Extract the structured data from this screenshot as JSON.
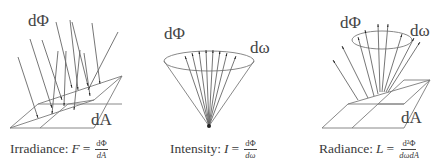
{
  "panels": [
    {
      "id": "irradiance",
      "labels": {
        "flux": "dΦ",
        "area": "dA"
      },
      "caption": {
        "name": "Irradiance:",
        "symbol": "F",
        "equals": "=",
        "numerator": "dΦ",
        "denominator": "dA"
      }
    },
    {
      "id": "intensity",
      "labels": {
        "flux": "dΦ",
        "solid_angle": "dω"
      },
      "caption": {
        "name": "Intensity:",
        "symbol": "I",
        "equals": "=",
        "numerator": "dΦ",
        "denominator": "dω"
      }
    },
    {
      "id": "radiance",
      "labels": {
        "flux": "dΦ",
        "solid_angle": "dω",
        "area": "dA"
      },
      "caption": {
        "name": "Radiance:",
        "symbol": "L",
        "equals": "=",
        "numerator": "d²Φ",
        "denominator": "dωdA"
      }
    }
  ],
  "colors": {
    "line": "#777777",
    "arrow": "#222222",
    "text": "#444444",
    "background": "#ffffff"
  }
}
